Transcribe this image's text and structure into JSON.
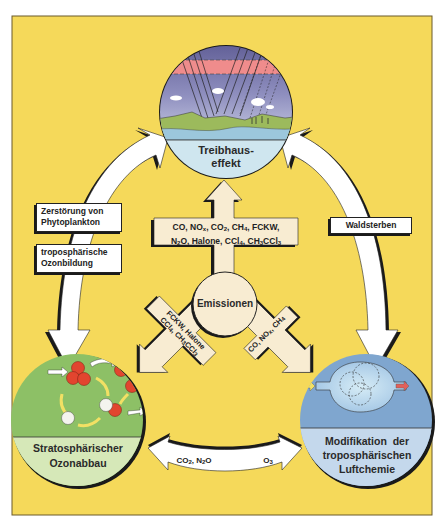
{
  "diagram": {
    "colors": {
      "background": "#f5d95a",
      "frame_border": "#6b5a2a",
      "arrow_fill": "#ffffff",
      "arrow_shadow": "#1a1a1a",
      "emission_arrow_fill": "#f8ecd2",
      "greenhouse_label_bg": "#cfe6ef",
      "stratosphere_bg": "#8dc066",
      "stratosphere_label_bg": "#d6e8b8",
      "troposphere_bg": "#7fa6cf",
      "troposphere_label_bg": "#c4d8ec",
      "sky_top": "#6d6aa0",
      "sky_band": "#ef8c8c",
      "land": "#9cba5c",
      "water": "#9cc7dc",
      "ozone_red": "#e2452f",
      "yellow_arrow": "#f2e064"
    },
    "nodes": {
      "greenhouse": {
        "title_line1": "Treibhaus-",
        "title_line2": "effekt"
      },
      "emissions": {
        "title": "Emissionen"
      },
      "stratosphere": {
        "title_line1": "Stratosphärischer",
        "title_line2": "Ozonabbau"
      },
      "troposphere": {
        "title_line1": "Modifikation  der",
        "title_line2": "troposphärischen",
        "title_line3": "Luftchemie"
      }
    },
    "edges": {
      "emissions_to_greenhouse": {
        "line1": [
          "CO, NO",
          "x",
          ", CO",
          "2",
          ", CH",
          "4",
          ", FCKW,"
        ],
        "line1_text": "CO, NOx, CO2, CH4, FCKW,",
        "line2_text": "N2O, Halone, CCl4, CH3CCl3"
      },
      "emissions_to_stratosphere": {
        "line1_text": "FCKW, Halone",
        "line2_text": "CCl4, CH3CCl3"
      },
      "emissions_to_troposphere": {
        "line1_text": "CO, NOx, CH4"
      },
      "greenhouse_to_stratosphere": {
        "label1_line1": "Zerstörung von",
        "label1_line2": "Phytoplankton",
        "label2_line1": "troposphärische",
        "label2_line2": "Ozonbildung"
      },
      "greenhouse_to_troposphere": {
        "label": "Waldsterben"
      },
      "troposphere_to_stratosphere": {
        "left_label": "CO2, N2O",
        "right_label": "O3"
      }
    }
  }
}
